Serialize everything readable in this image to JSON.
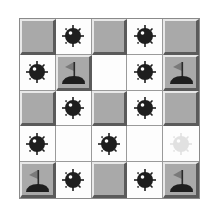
{
  "game": {
    "title": "Minesweeper board",
    "rows": 5,
    "cols": 5,
    "colors": {
      "raised_tile": "#a9a9a9",
      "revealed_tile": "#fdfdfd",
      "mine": "#1e1e1e",
      "flag": "#7a7a7a"
    },
    "grid": [
      [
        "raised",
        "mine",
        "raised",
        "mine",
        "raised"
      ],
      [
        "mine",
        "flag",
        "empty",
        "mine",
        "flag"
      ],
      [
        "raised",
        "mine",
        "raised",
        "mine",
        "raised"
      ],
      [
        "mine",
        "empty",
        "mine",
        "empty",
        "ghost-mine"
      ],
      [
        "flag",
        "mine",
        "raised",
        "mine",
        "flag"
      ]
    ]
  }
}
